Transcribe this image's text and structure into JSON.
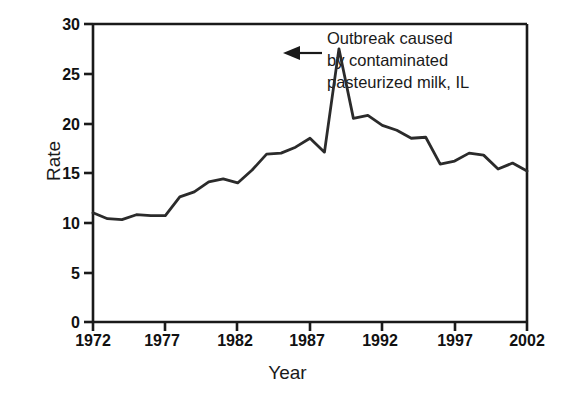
{
  "chart_data": {
    "type": "line",
    "title": "",
    "subtitle": "",
    "xlabel": "Year",
    "ylabel": "Rate",
    "xlim": [
      1972,
      2002
    ],
    "ylim": [
      0,
      30
    ],
    "xticks": [
      "1972",
      "1977",
      "1982",
      "1987",
      "1992",
      "1997",
      "2002"
    ],
    "yticks": [
      "0",
      "5",
      "10",
      "15",
      "20",
      "25",
      "30"
    ],
    "grid": false,
    "legend": "none",
    "line_color": "#2b2b2b",
    "x": [
      1972,
      1973,
      1974,
      1975,
      1976,
      1977,
      1978,
      1979,
      1980,
      1981,
      1982,
      1983,
      1984,
      1985,
      1986,
      1987,
      1988,
      1989,
      1990,
      1991,
      1992,
      1993,
      1994,
      1995,
      1996,
      1997,
      1998,
      1999,
      2000,
      2001,
      2002
    ],
    "values": [
      11.0,
      10.4,
      10.3,
      10.8,
      10.7,
      10.7,
      12.6,
      13.1,
      14.1,
      14.4,
      14.0,
      15.3,
      16.9,
      17.0,
      17.6,
      18.5,
      17.1,
      27.5,
      20.5,
      20.8,
      19.8,
      19.3,
      18.5,
      18.6,
      15.9,
      16.2,
      17.0,
      16.8,
      15.4,
      16.0,
      15.2
    ],
    "annotations": [
      {
        "text_lines": [
          "Outbreak caused",
          "by contaminated",
          "pasteurized milk, IL"
        ],
        "points_to_year": 1985,
        "points_to_value": 27.5,
        "arrow": "left-pointing-arrow"
      }
    ]
  },
  "axes": {
    "y_title": "Rate",
    "x_title": "Year",
    "y_tick_labels": [
      "30",
      "25",
      "20",
      "15",
      "10",
      "5",
      "0"
    ],
    "x_tick_labels": [
      "1972",
      "1977",
      "1982",
      "1987",
      "1992",
      "1997",
      "2002"
    ]
  },
  "annotation": {
    "line1": "Outbreak caused",
    "line2": "by contaminated",
    "line3": "pasteurized milk, IL"
  }
}
